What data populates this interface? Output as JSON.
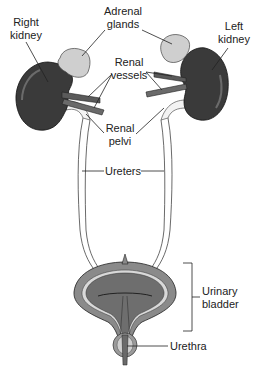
{
  "diagram": {
    "labels": {
      "right_kidney": [
        "Right",
        "kidney"
      ],
      "adrenal_glands": [
        "Adrenal",
        "glands"
      ],
      "left_kidney": [
        "Left",
        "kidney"
      ],
      "renal_vessels": [
        "Renal",
        "vessels"
      ],
      "renal_pelvi": [
        "Renal",
        "pelvi"
      ],
      "ureters": "Ureters",
      "urinary_bladder": [
        "Urinary",
        "bladder"
      ],
      "urethra": "Urethra"
    },
    "colors": {
      "kidney": "#3a3a3a",
      "kidney_highlight": "#6b6b6b",
      "adrenal": "#cfcfcf",
      "vessel": "#555555",
      "ureter": "#f2f2f2",
      "bladder_outer": "#8a8a8a",
      "bladder_inner": "#6e6e6e",
      "bladder_lining": "#d9d9d9",
      "leader_line": "#222222"
    }
  }
}
